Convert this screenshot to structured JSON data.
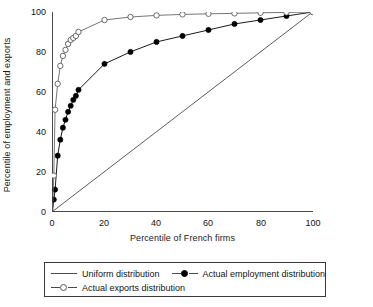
{
  "chart_data": {
    "type": "line",
    "title": "",
    "xlabel": "Percentile of French firms",
    "ylabel": "Percentile of employment and exports",
    "xlim": [
      0,
      100
    ],
    "ylim": [
      0,
      100
    ],
    "xticks": [
      0,
      20,
      40,
      60,
      80,
      100
    ],
    "yticks": [
      0,
      20,
      40,
      60,
      80,
      100
    ],
    "grid": false,
    "legend_position": "below",
    "series": [
      {
        "name": "Uniform distribution",
        "marker": "none",
        "color": "#4a4a4a",
        "x": [
          0,
          100
        ],
        "y": [
          0,
          100
        ]
      },
      {
        "name": "Actual employment distribution",
        "marker": "filled-circle",
        "color": "#000000",
        "x": [
          0,
          0.5,
          1,
          2,
          3,
          4,
          5,
          6,
          7,
          8,
          9,
          10,
          20,
          30,
          40,
          50,
          60,
          70,
          80,
          90,
          100
        ],
        "y": [
          0,
          6,
          11,
          28,
          36,
          42,
          46,
          50,
          53,
          56,
          58,
          61,
          74,
          80,
          85,
          88,
          91,
          94,
          96,
          98,
          100
        ]
      },
      {
        "name": "Actual exports distribution",
        "marker": "open-circle",
        "color": "#666666",
        "x": [
          0,
          0.5,
          1,
          2,
          3,
          4,
          5,
          6,
          7,
          8,
          9,
          10,
          20,
          30,
          40,
          50,
          60,
          70,
          80,
          90,
          100
        ],
        "y": [
          0,
          18,
          51,
          64,
          73,
          78,
          81,
          84,
          86,
          87,
          88,
          90,
          96,
          97.5,
          98.3,
          98.8,
          99.1,
          99.3,
          99.6,
          99.8,
          100
        ]
      }
    ]
  },
  "axes": {
    "x_title": "Percentile of French firms",
    "y_title": "Percentile of employment and exports",
    "x_tick_labels": [
      "0",
      "20",
      "40",
      "60",
      "80",
      "100"
    ],
    "y_tick_labels": [
      "0",
      "20",
      "40",
      "60",
      "80",
      "100"
    ]
  },
  "legend": {
    "items": [
      {
        "label": "Uniform distribution",
        "marker": "none"
      },
      {
        "label": "Actual employment distribution",
        "marker": "filled-circle"
      },
      {
        "label": "Actual exports distribution",
        "marker": "open-circle"
      }
    ]
  },
  "colors": {
    "axis": "#4a4a4a",
    "uniform_line": "#4a4a4a",
    "employment": "#000000",
    "exports": "#666666",
    "legend_border": "#3a3a3a"
  }
}
